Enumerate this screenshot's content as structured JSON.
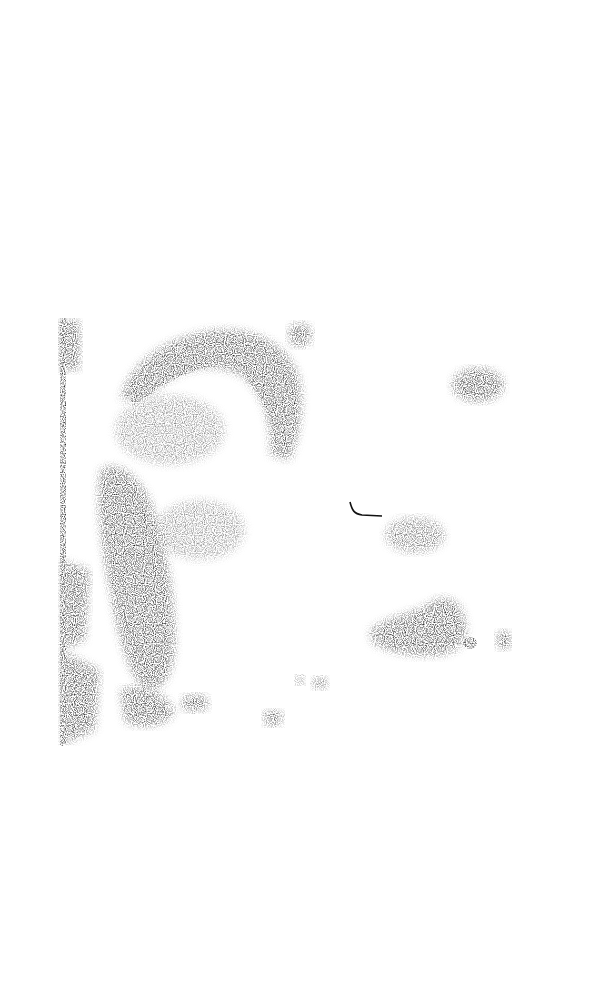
{
  "image": {
    "description": "Scanned, heavily degraded black-and-white halftone photograph printed on a page; a washed-out figure with dark ink masses on the left and scattered clusters to the right",
    "alt_text": "Degraded halftone photograph scan",
    "ink_color": "#111111",
    "paper_color": "#ffffff"
  }
}
